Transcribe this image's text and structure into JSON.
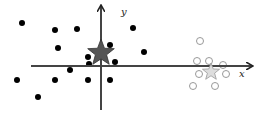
{
  "diagram": {
    "axes": {
      "x_label": "x",
      "y_label": "y",
      "color": "#444444",
      "x_axis": {
        "x1": 31,
        "x2": 252,
        "y": 66
      },
      "y_axis": {
        "x": 101,
        "y1": 6,
        "y2": 110
      }
    },
    "centroids": [
      {
        "name": "class-a-centroid",
        "shape": "star",
        "cx": 101,
        "cy": 53,
        "r": 14,
        "fill": "#555555",
        "stroke": "#333333"
      },
      {
        "name": "class-b-centroid",
        "shape": "star",
        "cx": 211,
        "cy": 72,
        "r": 9,
        "fill": "#dddddd",
        "stroke": "#999999"
      }
    ],
    "filled_points": {
      "color": "#000000",
      "radius": 3,
      "points": [
        [
          22,
          23
        ],
        [
          55,
          30
        ],
        [
          77,
          29
        ],
        [
          58,
          48
        ],
        [
          88,
          57
        ],
        [
          89,
          64
        ],
        [
          110,
          45
        ],
        [
          115,
          62
        ],
        [
          70,
          70
        ],
        [
          17,
          80
        ],
        [
          55,
          80
        ],
        [
          88,
          80
        ],
        [
          110,
          80
        ],
        [
          38,
          97
        ],
        [
          133,
          28
        ],
        [
          144,
          52
        ]
      ]
    },
    "open_points": {
      "color": "#999999",
      "radius": 3.5,
      "points": [
        [
          200,
          41
        ],
        [
          197,
          61
        ],
        [
          209,
          61
        ],
        [
          223,
          65
        ],
        [
          199,
          74
        ],
        [
          226,
          74
        ],
        [
          193,
          86
        ],
        [
          215,
          86
        ]
      ]
    }
  }
}
